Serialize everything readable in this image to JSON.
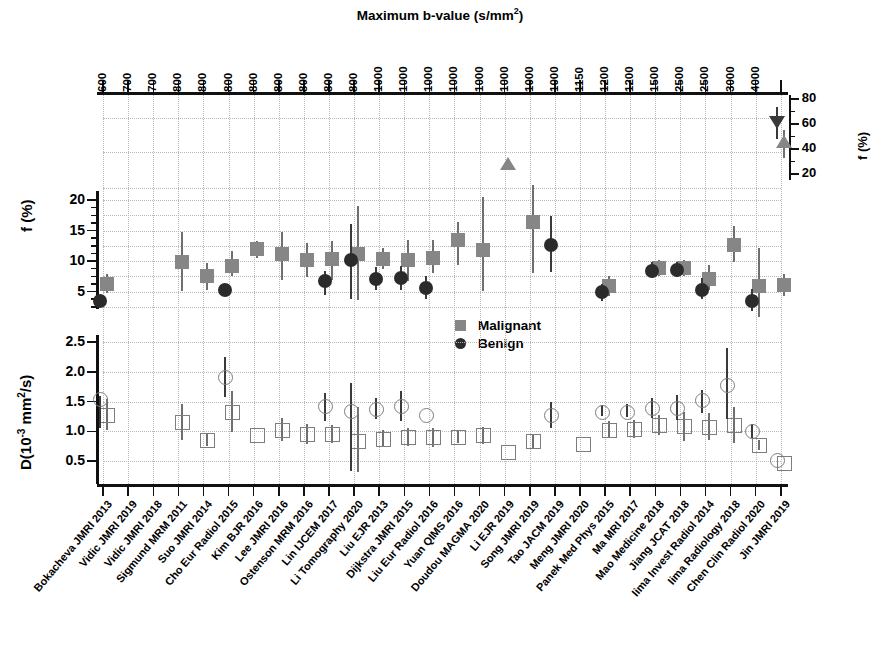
{
  "figure": {
    "top_axis_title": "Maximum b-value (s/mm",
    "top_axis_title_sup": "2",
    "top_axis_title_close": ")",
    "ylabel_f": "f (%)",
    "ylabel_d_main": "D(10",
    "ylabel_d_sup": "-3",
    "ylabel_d_rest": " mm",
    "ylabel_d_sup2": "2",
    "ylabel_d_tail": "/s)",
    "ylabel_inset": "f (%)"
  },
  "legend": {
    "position": "center",
    "items": [
      {
        "label": "Malignant",
        "marker": "filled-square",
        "color": "#868686"
      },
      {
        "label": "Benign",
        "marker": "filled-circle",
        "color": "#2b2b2b"
      }
    ]
  },
  "axes": {
    "f_ticks": [
      5,
      10,
      15,
      20
    ],
    "f_range": [
      0,
      22
    ],
    "d_ticks": [
      "0.5",
      "1.0",
      "1.5",
      "2.0",
      "2.5"
    ],
    "d_range": [
      0,
      2.7
    ],
    "inset_ticks": [
      20,
      40,
      60,
      80
    ],
    "inset_range": [
      15,
      85
    ],
    "grid": true
  },
  "chart_data": {
    "type": "scatter",
    "title": "Maximum b-value (s/mm2)",
    "xlabel": "",
    "ylabel": "f (%)  /  D(10-3 mm2/s)",
    "x_top_label": "Maximum b-value (s/mm2)",
    "categories": [
      "Bokacheva JMRI 2013",
      "Vidic JMRI 2019",
      "Vidic JMRI 2018",
      "Sigmund MRM 2011",
      "Suo JMRI 2014",
      "Cho Eur Radiol 2015",
      "Kim BJR 2016",
      "Lee JMRI 2016",
      "Ostenson MRM 2016",
      "Lin IJCEM 2017",
      "Li Tomography 2020",
      "Liu EJR 2013",
      "Dijkstra JMRI 2015",
      "Liu Eur Radiol 2016",
      "Yuan QIMS 2016",
      "Doudou MAGMA 2020",
      "Li EJR 2019",
      "Song JMRI 2019",
      "Tao JACM 2019",
      "Meng JMRI 2020",
      "Panek Med Phys 2015",
      "Ma MRI 2017",
      "Mao Medicine 2018",
      "Jiang JCAT 2018",
      "Iima Invest Radiol 2014",
      "Iima Radiology 2018",
      "Chen Clin Radiol 2020",
      "Jin JMRI 2019"
    ],
    "max_b_values": [
      600,
      700,
      700,
      800,
      800,
      800,
      800,
      800,
      800,
      800,
      800,
      1000,
      1000,
      1000,
      1000,
      1000,
      1000,
      1000,
      1000,
      1150,
      1200,
      1200,
      1500,
      2500,
      2500,
      3000,
      4000
    ],
    "series": [
      {
        "name": "Malignant f (%)",
        "marker": "filled-square",
        "values": [
          6.3,
          null,
          null,
          9.9,
          7.6,
          9.2,
          11.9,
          11.1,
          10.1,
          10.4,
          11.2,
          10.4,
          10.2,
          10.5,
          13.4,
          11.8,
          30.0,
          16.4,
          null,
          null,
          5.9,
          null,
          8.8,
          8.8,
          7.0,
          12.6,
          5.9,
          6.1
        ],
        "err_low": [
          4.8,
          null,
          null,
          5.0,
          5.2,
          7.6,
          10.5,
          6.9,
          7.4,
          6.9,
          3.6,
          8.7,
          6.8,
          8.0,
          9.3,
          5.0,
          null,
          8.1,
          null,
          null,
          4.2,
          null,
          7.6,
          7.5,
          5.2,
          9.8,
          0.9,
          4.2
        ],
        "err_high": [
          7.8,
          null,
          null,
          14.8,
          9.6,
          11.6,
          13.3,
          14.7,
          13.0,
          13.2,
          19.0,
          12.1,
          13.4,
          13.4,
          16.4,
          20.5,
          null,
          22.4,
          null,
          null,
          7.6,
          null,
          10.1,
          10.1,
          9.3,
          15.8,
          12.2,
          7.8
        ]
      },
      {
        "name": "Benign f (%)",
        "marker": "filled-circle",
        "values": [
          3.5,
          null,
          null,
          null,
          null,
          5.2,
          null,
          null,
          null,
          6.7,
          10.2,
          7.1,
          7.2,
          5.5,
          null,
          null,
          null,
          null,
          12.7,
          null,
          5.0,
          null,
          8.4,
          8.5,
          5.3,
          null,
          3.5,
          null
        ],
        "err_low": [
          2.6,
          null,
          null,
          null,
          null,
          4.2,
          null,
          null,
          null,
          4.4,
          3.8,
          5.2,
          5.3,
          3.7,
          null,
          null,
          null,
          null,
          8.2,
          null,
          3.4,
          null,
          7.2,
          7.4,
          3.7,
          null,
          1.8,
          null
        ],
        "err_high": [
          4.4,
          null,
          null,
          null,
          null,
          6.3,
          null,
          null,
          null,
          8.3,
          16.1,
          9.0,
          9.2,
          7.6,
          null,
          null,
          null,
          null,
          17.4,
          null,
          6.3,
          null,
          9.8,
          9.9,
          7.2,
          null,
          5.4,
          null
        ]
      },
      {
        "name": "Malignant f high (inset axis)",
        "marker": "filled-triangle-up",
        "inset": true,
        "values": [
          null,
          null,
          null,
          null,
          null,
          null,
          null,
          null,
          null,
          null,
          null,
          null,
          null,
          null,
          null,
          null,
          null,
          null,
          null,
          null,
          null,
          null,
          null,
          null,
          null,
          null,
          null,
          46.0
        ],
        "err_low": [
          null,
          null,
          null,
          null,
          null,
          null,
          null,
          null,
          null,
          null,
          null,
          null,
          null,
          null,
          null,
          null,
          null,
          null,
          null,
          null,
          null,
          null,
          null,
          null,
          null,
          null,
          null,
          33.0
        ],
        "err_high": [
          null,
          null,
          null,
          null,
          null,
          null,
          null,
          null,
          null,
          null,
          null,
          null,
          null,
          null,
          null,
          null,
          null,
          null,
          null,
          null,
          null,
          null,
          null,
          null,
          null,
          null,
          null,
          55.0
        ]
      },
      {
        "name": "Benign f high (inset axis)",
        "marker": "filled-triangle-down",
        "inset": true,
        "values": [
          null,
          null,
          null,
          null,
          null,
          null,
          null,
          null,
          null,
          null,
          null,
          null,
          null,
          null,
          null,
          null,
          null,
          null,
          null,
          null,
          null,
          null,
          null,
          null,
          null,
          null,
          null,
          62.0
        ],
        "err_low": [
          null,
          null,
          null,
          null,
          null,
          null,
          null,
          null,
          null,
          null,
          null,
          null,
          null,
          null,
          null,
          null,
          null,
          null,
          null,
          null,
          null,
          null,
          null,
          null,
          null,
          null,
          null,
          48.0
        ],
        "err_high": [
          null,
          null,
          null,
          null,
          null,
          null,
          null,
          null,
          null,
          null,
          null,
          null,
          null,
          null,
          null,
          null,
          null,
          null,
          null,
          null,
          null,
          null,
          null,
          null,
          null,
          null,
          null,
          74.0
        ]
      },
      {
        "name": "Malignant D (10-3 mm2/s)",
        "marker": "open-square",
        "panel": "D",
        "values": [
          1.28,
          null,
          null,
          1.15,
          0.85,
          1.33,
          0.93,
          1.02,
          0.95,
          0.95,
          0.83,
          0.87,
          0.9,
          0.91,
          0.9,
          0.93,
          0.65,
          0.83,
          null,
          0.79,
          1.02,
          1.03,
          1.1,
          1.09,
          1.07,
          1.1,
          0.77,
          0.47
        ],
        "err_low": [
          1.02,
          null,
          null,
          0.86,
          0.75,
          0.99,
          null,
          0.83,
          0.78,
          0.8,
          0.31,
          0.74,
          0.76,
          0.74,
          0.8,
          0.79,
          null,
          0.72,
          null,
          null,
          0.88,
          0.88,
          0.94,
          0.84,
          0.85,
          0.8,
          0.68,
          null
        ],
        "err_high": [
          1.55,
          null,
          null,
          1.45,
          0.97,
          1.68,
          null,
          1.22,
          1.12,
          1.11,
          1.4,
          1.02,
          1.06,
          1.06,
          1.01,
          1.07,
          null,
          0.95,
          null,
          null,
          1.17,
          1.19,
          1.27,
          1.32,
          1.3,
          1.4,
          0.86,
          null
        ]
      },
      {
        "name": "Benign D (10-3 mm2/s)",
        "marker": "open-circle",
        "panel": "D",
        "values": [
          1.55,
          null,
          null,
          null,
          null,
          1.91,
          null,
          null,
          null,
          1.42,
          1.34,
          1.38,
          1.42,
          1.27,
          null,
          null,
          null,
          null,
          1.27,
          null,
          1.33,
          1.32,
          1.39,
          1.39,
          1.52,
          1.78,
          1.01,
          0.51
        ],
        "err_low": [
          1.05,
          null,
          null,
          null,
          null,
          1.57,
          null,
          null,
          null,
          1.17,
          0.33,
          1.2,
          1.18,
          null,
          null,
          null,
          null,
          null,
          1.05,
          null,
          1.25,
          1.24,
          1.23,
          1.19,
          1.3,
          1.2,
          0.88,
          null
        ],
        "err_high": [
          1.6,
          null,
          null,
          null,
          null,
          2.25,
          null,
          null,
          null,
          1.65,
          1.81,
          1.56,
          1.67,
          null,
          null,
          null,
          null,
          null,
          1.5,
          null,
          1.44,
          1.46,
          1.56,
          1.61,
          1.69,
          2.4,
          1.13,
          null
        ]
      }
    ]
  }
}
